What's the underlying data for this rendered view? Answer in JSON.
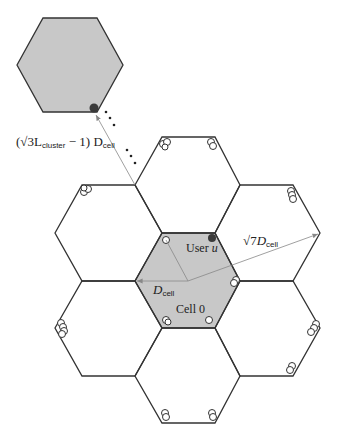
{
  "diagram": {
    "type": "hexagonal-cellular-layout",
    "cells": 7,
    "colors": {
      "shaded": "#c8c8c8",
      "line": "#333333",
      "user": "#3a3a3a",
      "arrow": "#888888"
    },
    "labels": {
      "user": "User u",
      "user_prefix": "User ",
      "user_var": "u",
      "cell0": "Cell 0",
      "dcell_var": "D",
      "dcell_sub": "cell",
      "sqrt7": "√7",
      "cluster_open": "(√3L",
      "cluster_sub": "cluster",
      "cluster_close": " − 1) D"
    },
    "annotations": [
      "D_cell",
      "√7 D_cell",
      "(√(3 L_cluster) − 1) D_cell"
    ]
  }
}
